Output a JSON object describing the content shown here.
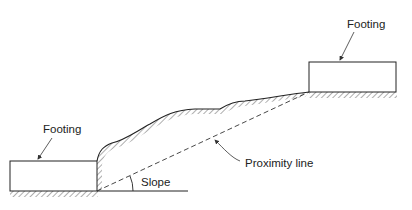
{
  "diagram": {
    "labels": {
      "footing_left": "Footing",
      "footing_right": "Footing",
      "proximity_line": "Proximity line",
      "slope": "Slope"
    },
    "colors": {
      "stroke": "#222222",
      "background": "#ffffff"
    }
  }
}
